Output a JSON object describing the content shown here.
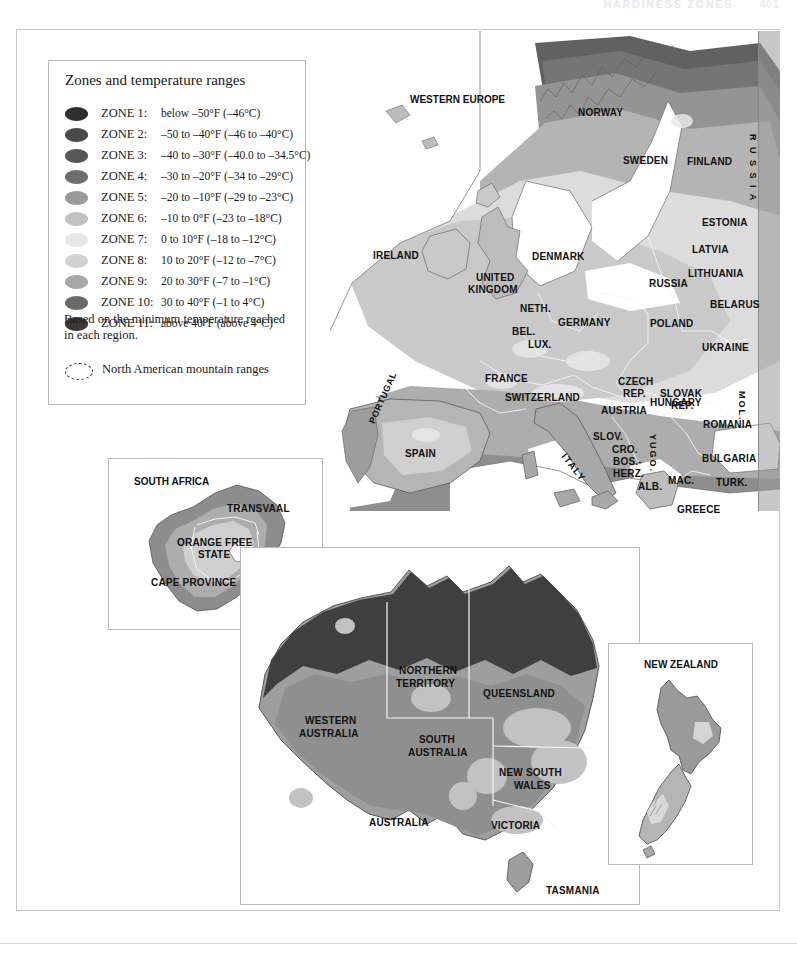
{
  "page": {
    "running_head": "HARDINESS ZONES",
    "folio": "401"
  },
  "legend": {
    "title": "Zones and temperature ranges",
    "note": "Based on the minimum temperature reached in each region.",
    "mountain_label": "North American mountain ranges",
    "zones": [
      {
        "name": "ZONE 1:",
        "range": "below –50°F (–46°C)",
        "color": "#2f2f2f"
      },
      {
        "name": "ZONE 2:",
        "range": "–50 to –40°F (–46 to –40°C)",
        "color": "#4a4a4a"
      },
      {
        "name": "ZONE 3:",
        "range": "–40 to –30°F (–40.0 to –34.5°C)",
        "color": "#575757"
      },
      {
        "name": "ZONE 4:",
        "range": "–30 to –20°F (–34 to –29°C)",
        "color": "#6e6e6e"
      },
      {
        "name": "ZONE 5:",
        "range": "–20 to –10°F (–29 to –23°C)",
        "color": "#9a9a9a"
      },
      {
        "name": "ZONE 6:",
        "range": "–10 to 0°F (–23 to –18°C)",
        "color": "#c2c2c2"
      },
      {
        "name": "ZONE 7:",
        "range": "0 to 10°F (–18 to –12°C)",
        "color": "#e6e6e6"
      },
      {
        "name": "ZONE 8:",
        "range": "10 to 20°F (–12 to –7°C)",
        "color": "#d2d2d2"
      },
      {
        "name": "ZONE 9:",
        "range": "20 to 30°F (–7 to –1°C)",
        "color": "#a8a8a8"
      },
      {
        "name": "ZONE 10:",
        "range": "30 to 40°F (–1 to 4°C)",
        "color": "#6a6a6a"
      },
      {
        "name": "ZONE 11:",
        "range": "above 40°F (above 4°C)",
        "color": "#3a3a3a"
      }
    ]
  },
  "europe": {
    "title": "WESTERN EUROPE",
    "labels": [
      {
        "text": "NORWAY",
        "x": 248,
        "y": 76,
        "size": "big"
      },
      {
        "text": "SWEDEN",
        "x": 293,
        "y": 124,
        "size": "big"
      },
      {
        "text": "FINLAND",
        "x": 357,
        "y": 125,
        "size": "big"
      },
      {
        "text": "R U S S I A",
        "x": 417,
        "y": 103,
        "size": "vert"
      },
      {
        "text": "ESTONIA",
        "x": 372,
        "y": 186,
        "size": "big"
      },
      {
        "text": "LATVIA",
        "x": 362,
        "y": 213,
        "size": "big"
      },
      {
        "text": "LITHUANIA",
        "x": 358,
        "y": 237,
        "size": "big"
      },
      {
        "text": "BELARUS",
        "x": 380,
        "y": 268,
        "size": "big"
      },
      {
        "text": "IRELAND",
        "x": 43,
        "y": 219,
        "size": "big"
      },
      {
        "text": "UNITED",
        "x": 146,
        "y": 241,
        "size": "big"
      },
      {
        "text": "KINGDOM",
        "x": 138,
        "y": 253,
        "size": "big"
      },
      {
        "text": "DENMARK",
        "x": 202,
        "y": 220,
        "size": "big"
      },
      {
        "text": "RUSSIA",
        "x": 319,
        "y": 247,
        "size": "big"
      },
      {
        "text": "NETH.",
        "x": 190,
        "y": 272,
        "size": "big"
      },
      {
        "text": "BEL.",
        "x": 182,
        "y": 295,
        "size": "big"
      },
      {
        "text": "LUX.",
        "x": 198,
        "y": 308,
        "size": "big"
      },
      {
        "text": "GERMANY",
        "x": 228,
        "y": 286,
        "size": "big"
      },
      {
        "text": "POLAND",
        "x": 320,
        "y": 287,
        "size": "big"
      },
      {
        "text": "CZECH",
        "x": 288,
        "y": 345,
        "size": "big"
      },
      {
        "text": "REP.",
        "x": 293,
        "y": 357,
        "size": "big"
      },
      {
        "text": "SLOVAK",
        "x": 330,
        "y": 357,
        "size": "big"
      },
      {
        "text": "REP.",
        "x": 341,
        "y": 369,
        "size": "big"
      },
      {
        "text": "UKRAINE",
        "x": 372,
        "y": 311,
        "size": "big"
      },
      {
        "text": "FRANCE",
        "x": 155,
        "y": 342,
        "size": "big"
      },
      {
        "text": "SWITZERLAND",
        "x": 175,
        "y": 361,
        "size": "big"
      },
      {
        "text": "AUSTRIA",
        "x": 271,
        "y": 374,
        "size": "big"
      },
      {
        "text": "HUNGARY",
        "x": 320,
        "y": 366,
        "size": "big"
      },
      {
        "text": "SLOV.",
        "x": 263,
        "y": 400,
        "size": "big"
      },
      {
        "text": "CRO.",
        "x": 282,
        "y": 413,
        "size": "big"
      },
      {
        "text": "BOS.-",
        "x": 283,
        "y": 425,
        "size": "big"
      },
      {
        "text": "HERZ.",
        "x": 283,
        "y": 437,
        "size": "big"
      },
      {
        "text": "ROMANIA",
        "x": 373,
        "y": 388,
        "size": "big"
      },
      {
        "text": "MOL.",
        "x": 406,
        "y": 360,
        "size": "vert"
      },
      {
        "text": "YUGO.",
        "x": 317,
        "y": 403,
        "size": "vert"
      },
      {
        "text": "BULGARIA",
        "x": 372,
        "y": 422,
        "size": "big"
      },
      {
        "text": "MAC.",
        "x": 338,
        "y": 444,
        "size": "big"
      },
      {
        "text": "ALB.",
        "x": 308,
        "y": 450,
        "size": "big"
      },
      {
        "text": "TURK.",
        "x": 386,
        "y": 446,
        "size": "big"
      },
      {
        "text": "GREECE",
        "x": 347,
        "y": 473,
        "size": "big"
      },
      {
        "text": "PORTUGAL",
        "x": 37,
        "y": 390,
        "size": "rot"
      },
      {
        "text": "SPAIN",
        "x": 75,
        "y": 417,
        "size": "big"
      },
      {
        "text": "ITALY",
        "x": 238,
        "y": 420,
        "size": "rot2"
      }
    ]
  },
  "south_africa": {
    "title": "SOUTH AFRICA",
    "labels": [
      {
        "text": "TRANSVAAL",
        "x": 118,
        "y": 44
      },
      {
        "text": "ORANGE FREE",
        "x": 68,
        "y": 78
      },
      {
        "text": "STATE",
        "x": 89,
        "y": 90
      },
      {
        "text": "NATAL",
        "x": 150,
        "y": 90
      },
      {
        "text": "CAPE PROVINCE",
        "x": 42,
        "y": 118
      },
      {
        "text": "LESOTHO",
        "x": 145,
        "y": 128
      }
    ]
  },
  "australia": {
    "title": "AUSTRALIA",
    "labels": [
      {
        "text": "NORTHERN",
        "x": 158,
        "y": 117
      },
      {
        "text": "TERRITORY",
        "x": 155,
        "y": 130
      },
      {
        "text": "QUEENSLAND",
        "x": 242,
        "y": 140
      },
      {
        "text": "WESTERN",
        "x": 64,
        "y": 167
      },
      {
        "text": "AUSTRALIA",
        "x": 58,
        "y": 180
      },
      {
        "text": "SOUTH",
        "x": 178,
        "y": 186
      },
      {
        "text": "AUSTRALIA",
        "x": 167,
        "y": 199
      },
      {
        "text": "NEW SOUTH",
        "x": 258,
        "y": 219
      },
      {
        "text": "WALES",
        "x": 273,
        "y": 232
      },
      {
        "text": "AUSTRALIA",
        "x": 128,
        "y": 269
      },
      {
        "text": "VICTORIA",
        "x": 250,
        "y": 272
      },
      {
        "text": "TASMANIA",
        "x": 305,
        "y": 337
      }
    ]
  },
  "new_zealand": {
    "title": "NEW ZEALAND"
  },
  "chart_data": {
    "type": "map",
    "legend_position": "top-left",
    "scale": "USDA-style plant hardiness zones 1–11",
    "insets": [
      "Western Europe",
      "South Africa",
      "Australia",
      "New Zealand"
    ]
  }
}
